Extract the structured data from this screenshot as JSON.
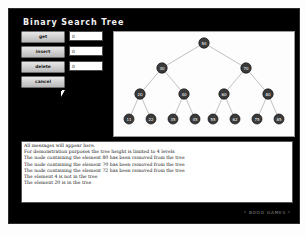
{
  "app": {
    "title": "Binary Search Tree",
    "watermark": "* BOOO GAMES *"
  },
  "controls": {
    "rows": [
      {
        "button": "get",
        "value": "0",
        "placeholder": "0"
      },
      {
        "button": "insert",
        "value": "0",
        "placeholder": "0"
      },
      {
        "button": "delete",
        "value": "0",
        "placeholder": "0"
      }
    ],
    "reset_button": "cancel"
  },
  "log": {
    "lines": [
      "All messages will appear here.",
      "For demonstration purposes the tree height is limited to 4 levels",
      "The node containing the element 80 has been removed from the tree",
      "The node containing the element 70 has been removed from the tree",
      "The node containing the element 72 has been removed from the tree",
      "The element 4 is not in the tree",
      "The element 20 is in the tree"
    ]
  },
  "tree": {
    "node_fill": "#3a3a3a",
    "node_stroke": "#111111",
    "edge_color": "#b0b0b0",
    "label_color": "#ffffff",
    "nodes": [
      {
        "id": "n0",
        "label": "50",
        "x": 90,
        "y": 11,
        "r": 5.2
      },
      {
        "id": "n1",
        "label": "30",
        "x": 48,
        "y": 36,
        "r": 5.2
      },
      {
        "id": "n2",
        "label": "70",
        "x": 132,
        "y": 36,
        "r": 5.2
      },
      {
        "id": "n3",
        "label": "20",
        "x": 26,
        "y": 62,
        "r": 5.2
      },
      {
        "id": "n4",
        "label": "40",
        "x": 70,
        "y": 62,
        "r": 5.2
      },
      {
        "id": "n5",
        "label": "60",
        "x": 110,
        "y": 62,
        "r": 5.2
      },
      {
        "id": "n6",
        "label": "80",
        "x": 154,
        "y": 62,
        "r": 5.2
      },
      {
        "id": "n7",
        "label": "11",
        "x": 15,
        "y": 87,
        "r": 5.0
      },
      {
        "id": "n8",
        "label": "22",
        "x": 37,
        "y": 87,
        "r": 5.0
      },
      {
        "id": "n9",
        "label": "35",
        "x": 59,
        "y": 87,
        "r": 5.0
      },
      {
        "id": "n10",
        "label": "45",
        "x": 81,
        "y": 87,
        "r": 5.0
      },
      {
        "id": "n11",
        "label": "55",
        "x": 99,
        "y": 87,
        "r": 5.0
      },
      {
        "id": "n12",
        "label": "62",
        "x": 121,
        "y": 87,
        "r": 5.0
      },
      {
        "id": "n13",
        "label": "75",
        "x": 143,
        "y": 87,
        "r": 5.0
      },
      {
        "id": "n14",
        "label": "85",
        "x": 165,
        "y": 87,
        "r": 5.0
      }
    ],
    "edges": [
      {
        "x1": 90,
        "y1": 11,
        "x2": 48,
        "y2": 36
      },
      {
        "x1": 90,
        "y1": 11,
        "x2": 132,
        "y2": 36
      },
      {
        "x1": 48,
        "y1": 36,
        "x2": 26,
        "y2": 62
      },
      {
        "x1": 48,
        "y1": 36,
        "x2": 70,
        "y2": 62
      },
      {
        "x1": 132,
        "y1": 36,
        "x2": 110,
        "y2": 62
      },
      {
        "x1": 132,
        "y1": 36,
        "x2": 154,
        "y2": 62
      },
      {
        "x1": 26,
        "y1": 62,
        "x2": 15,
        "y2": 87
      },
      {
        "x1": 26,
        "y1": 62,
        "x2": 37,
        "y2": 87
      },
      {
        "x1": 70,
        "y1": 62,
        "x2": 59,
        "y2": 87
      },
      {
        "x1": 70,
        "y1": 62,
        "x2": 81,
        "y2": 87
      },
      {
        "x1": 110,
        "y1": 62,
        "x2": 99,
        "y2": 87
      },
      {
        "x1": 110,
        "y1": 62,
        "x2": 121,
        "y2": 87
      },
      {
        "x1": 154,
        "y1": 62,
        "x2": 143,
        "y2": 87
      },
      {
        "x1": 154,
        "y1": 62,
        "x2": 165,
        "y2": 87
      }
    ]
  }
}
